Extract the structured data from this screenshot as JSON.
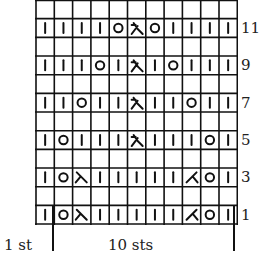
{
  "chart_data": {
    "type": "table",
    "columns": 11,
    "rows_visible": 12,
    "row_labels": [
      "11",
      "9",
      "7",
      "5",
      "3",
      "1"
    ],
    "legend_symbols": {
      "k": "knit (vertical bar)",
      "o": "yarn over (circle)",
      "cdd": "central double decrease (sl1-k2tog-psso, lambda with bar)",
      "ssk": "left-leaning decrease (\\)",
      "k2tog": "right-leaning decrease (/)",
      "": "empty (wrong-side row, purl as established)"
    },
    "grid_top_to_bottom": [
      {
        "row": 12,
        "label": "",
        "cells": [
          "",
          "",
          "",
          "",
          "",
          "",
          "",
          "",
          "",
          "",
          ""
        ]
      },
      {
        "row": 11,
        "label": "11",
        "cells": [
          "k",
          "k",
          "k",
          "k",
          "o",
          "cdd",
          "o",
          "k",
          "k",
          "k",
          "k"
        ]
      },
      {
        "row": 10,
        "label": "",
        "cells": [
          "",
          "",
          "",
          "",
          "",
          "",
          "",
          "",
          "",
          "",
          ""
        ]
      },
      {
        "row": 9,
        "label": "9",
        "cells": [
          "k",
          "k",
          "k",
          "o",
          "k",
          "cdd",
          "k",
          "o",
          "k",
          "k",
          "k"
        ]
      },
      {
        "row": 8,
        "label": "",
        "cells": [
          "",
          "",
          "",
          "",
          "",
          "",
          "",
          "",
          "",
          "",
          ""
        ]
      },
      {
        "row": 7,
        "label": "7",
        "cells": [
          "k",
          "k",
          "o",
          "k",
          "k",
          "cdd",
          "k",
          "k",
          "o",
          "k",
          "k"
        ]
      },
      {
        "row": 6,
        "label": "",
        "cells": [
          "",
          "",
          "",
          "",
          "",
          "",
          "",
          "",
          "",
          "",
          ""
        ]
      },
      {
        "row": 5,
        "label": "5",
        "cells": [
          "k",
          "o",
          "k",
          "k",
          "k",
          "cdd",
          "k",
          "k",
          "k",
          "o",
          "k"
        ]
      },
      {
        "row": 4,
        "label": "",
        "cells": [
          "",
          "",
          "",
          "",
          "",
          "",
          "",
          "",
          "",
          "",
          ""
        ]
      },
      {
        "row": 3,
        "label": "3",
        "cells": [
          "k",
          "o",
          "ssk",
          "k",
          "k",
          "k",
          "k",
          "k",
          "k2tog",
          "o",
          "k"
        ]
      },
      {
        "row": 2,
        "label": "",
        "cells": [
          "",
          "",
          "",
          "",
          "",
          "",
          "",
          "",
          "",
          "",
          ""
        ]
      },
      {
        "row": 1,
        "label": "1",
        "cells": [
          "k",
          "o",
          "ssk",
          "k",
          "k",
          "k",
          "k",
          "k",
          "k2tog",
          "o",
          "k"
        ]
      }
    ],
    "footer": {
      "left_label": "1 st",
      "repeat_label": "10 sts"
    }
  },
  "footer": {
    "left_label": "1 st",
    "repeat_label": "10 sts"
  },
  "colors": {
    "ink": "#111111",
    "background": "#ffffff"
  }
}
